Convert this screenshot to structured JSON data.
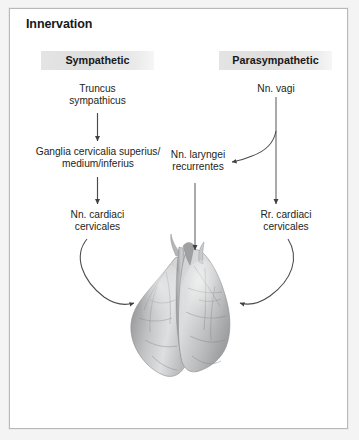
{
  "panel": {
    "title": "Innervation",
    "border_color": "#b7b9bb",
    "background": "#ffffff"
  },
  "columns": [
    {
      "id": "sympathetic",
      "label": "Sympathetic"
    },
    {
      "id": "parasympathetic",
      "label": "Parasympathetic"
    }
  ],
  "nodes": {
    "truncus_sympathicus": "Truncus\nsympathicus",
    "ganglia_cervicalia": "Ganglia cervicalia superius/\nmedium/inferius",
    "nn_cardiaci_cervicales": "Nn. cardiaci\ncervicales",
    "nn_vagi": "Nn. vagi",
    "nn_laryngei_recurrentes": "Nn. laryngei\nrecurrentes",
    "rr_cardiaci_cervicales": "Rr. cardiaci\ncervicales"
  },
  "illustration": {
    "name": "lungs",
    "style": "grayscale anatomical drawing",
    "base_color": "#a8a9ab",
    "highlight_color": "#e3e4e5",
    "shadow_color": "#6e7073"
  },
  "connectors": [
    {
      "from": "truncus_sympathicus",
      "to": "ganglia_cervicalia",
      "shape": "straight-down"
    },
    {
      "from": "ganglia_cervicalia",
      "to": "nn_cardiaci_cervicales",
      "shape": "straight-down"
    },
    {
      "from": "nn_cardiaci_cervicales",
      "to": "lungs",
      "shape": "curve-right-down"
    },
    {
      "from": "nn_vagi",
      "to": "nn_laryngei_recurrentes",
      "shape": "branch-left"
    },
    {
      "from": "nn_vagi",
      "to": "rr_cardiaci_cervicales",
      "shape": "straight-down"
    },
    {
      "from": "nn_laryngei_recurrentes",
      "to": "lungs",
      "shape": "straight-down"
    },
    {
      "from": "rr_cardiaci_cervicales",
      "to": "lungs",
      "shape": "curve-left-down"
    }
  ],
  "colors": {
    "arrow": "#4a4b4d",
    "text": "#1d1e20",
    "header_chip": "#e3e3e3"
  }
}
